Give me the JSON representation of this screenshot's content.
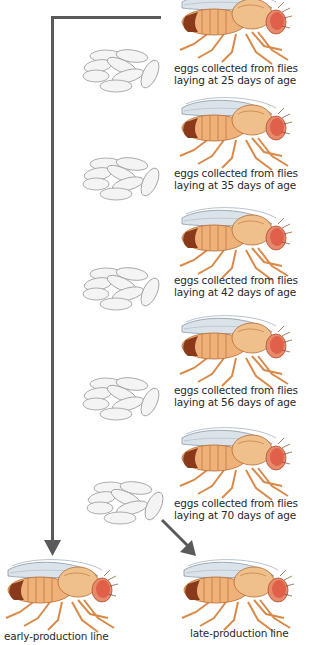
{
  "diagram": {
    "generations": [
      {
        "caption_line1": "eggs collected from flies",
        "caption_line2": "laying at 25 days of age"
      },
      {
        "caption_line1": "eggs collected from flies",
        "caption_line2": "laying at 35 days of age"
      },
      {
        "caption_line1": "eggs collected from flies",
        "caption_line2": "laying at 42 days of age"
      },
      {
        "caption_line1": "eggs collected from flies",
        "caption_line2": "laying at 56 days of age"
      },
      {
        "caption_line1": "eggs collected from flies",
        "caption_line2": "laying at 70 days of age"
      }
    ],
    "outcomes": {
      "early": "early-production line",
      "late": "late-production line"
    },
    "icons": {
      "fly": "fruit-fly-icon",
      "eggs": "egg-cluster-icon",
      "arrow": "arrow-icon"
    },
    "colors": {
      "arrow": "#5a5a5a",
      "fly_body": "#e9a766",
      "fly_eye": "#e0604a",
      "fly_abdomen_tip": "#8a3a1a",
      "egg_fill": "#f4f4f4",
      "egg_stroke": "#9a9a9a",
      "wing": "#c9d4dc"
    }
  }
}
